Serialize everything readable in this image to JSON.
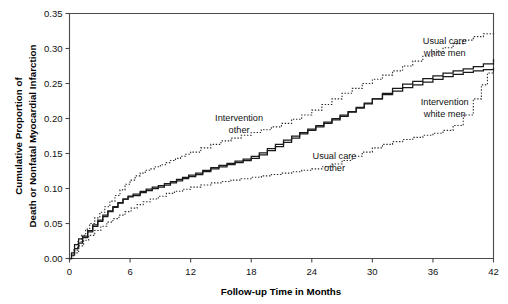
{
  "chart_data": {
    "type": "line",
    "title": "",
    "subtitle": "",
    "xlabel": "Follow-up Time in Months",
    "ylabel": "Cumulative Proportion of Death or Nonfatal Myocardial Infarction",
    "ylabel_line1": "Cumulative Proportion of",
    "ylabel_line2": "Death or Nonfatal Myocardial Infarction",
    "xlim": [
      0,
      42
    ],
    "ylim": [
      0,
      0.35
    ],
    "xticks": [
      0,
      6,
      12,
      18,
      24,
      30,
      36,
      42
    ],
    "xticklabels": [
      "0",
      "6",
      "12",
      "18",
      "24",
      "30",
      "36",
      "42"
    ],
    "yticks": [
      0.0,
      0.05,
      0.1,
      0.15,
      0.2,
      0.25,
      0.3,
      0.35
    ],
    "yticklabels": [
      "0.00",
      "0.05",
      "0.10",
      "0.15",
      "0.20",
      "0.25",
      "0.30",
      "0.35"
    ],
    "grid": false,
    "legend_position": "inline-annotations",
    "step_style": "post",
    "series": [
      {
        "name": "Usual care white men",
        "style": "dotted",
        "color": "#2b2b2b",
        "final_value": 0.325,
        "x": [
          0,
          0.4,
          0.8,
          1.2,
          1.6,
          2.0,
          2.5,
          3.0,
          3.5,
          4.0,
          4.5,
          5.0,
          5.5,
          6.0,
          6.5,
          7.0,
          7.5,
          8.0,
          8.5,
          9.0,
          9.5,
          10.0,
          10.5,
          11.0,
          11.5,
          12.0,
          13.0,
          14.0,
          15.0,
          16.0,
          17.0,
          18.0,
          19.0,
          20.0,
          21.0,
          22.0,
          23.0,
          24.0,
          25.0,
          26.0,
          27.0,
          28.0,
          29.0,
          30.0,
          31.0,
          32.0,
          33.0,
          34.0,
          35.0,
          36.0,
          37.0,
          38.0,
          39.0,
          40.0,
          41.0,
          42.0
        ],
        "y": [
          0.0,
          0.012,
          0.024,
          0.033,
          0.042,
          0.05,
          0.058,
          0.066,
          0.074,
          0.082,
          0.09,
          0.098,
          0.106,
          0.112,
          0.118,
          0.122,
          0.126,
          0.128,
          0.131,
          0.134,
          0.137,
          0.14,
          0.143,
          0.146,
          0.149,
          0.152,
          0.158,
          0.163,
          0.168,
          0.172,
          0.176,
          0.18,
          0.184,
          0.188,
          0.193,
          0.199,
          0.205,
          0.212,
          0.22,
          0.228,
          0.236,
          0.243,
          0.25,
          0.256,
          0.262,
          0.268,
          0.275,
          0.282,
          0.289,
          0.295,
          0.301,
          0.307,
          0.312,
          0.317,
          0.321,
          0.325
        ]
      },
      {
        "name": "Usual care other",
        "style": "solid",
        "color": "#1a1a1a",
        "final_value": 0.285,
        "x": [
          0,
          0.2,
          0.5,
          0.9,
          1.3,
          1.8,
          2.3,
          2.8,
          3.3,
          3.8,
          4.3,
          4.8,
          5.3,
          5.8,
          6.3,
          7.0,
          7.6,
          8.2,
          8.8,
          9.4,
          10.0,
          10.6,
          11.2,
          11.8,
          12.5,
          13.2,
          14.0,
          14.8,
          15.6,
          16.4,
          17.2,
          18.0,
          18.8,
          19.6,
          20.4,
          21.2,
          22.0,
          22.8,
          23.6,
          24.4,
          25.2,
          26.0,
          26.8,
          27.6,
          28.4,
          29.2,
          30.0,
          31.0,
          32.0,
          33.0,
          34.0,
          35.0,
          36.0,
          37.0,
          38.0,
          39.0,
          40.0,
          41.0,
          42.0
        ],
        "y": [
          0.0,
          0.008,
          0.02,
          0.028,
          0.03,
          0.038,
          0.046,
          0.053,
          0.06,
          0.067,
          0.073,
          0.079,
          0.085,
          0.088,
          0.09,
          0.094,
          0.097,
          0.1,
          0.102,
          0.105,
          0.108,
          0.111,
          0.114,
          0.117,
          0.12,
          0.124,
          0.128,
          0.131,
          0.134,
          0.137,
          0.14,
          0.143,
          0.148,
          0.154,
          0.16,
          0.166,
          0.172,
          0.178,
          0.183,
          0.188,
          0.193,
          0.198,
          0.203,
          0.209,
          0.215,
          0.221,
          0.228,
          0.236,
          0.243,
          0.249,
          0.253,
          0.257,
          0.261,
          0.265,
          0.268,
          0.271,
          0.274,
          0.278,
          0.285
        ]
      },
      {
        "name": "Intervention other",
        "style": "solid",
        "color": "#1a1a1a",
        "final_value": 0.272,
        "x": [
          0,
          0.2,
          0.5,
          0.9,
          1.3,
          1.8,
          2.3,
          2.8,
          3.3,
          3.8,
          4.3,
          4.8,
          5.3,
          5.8,
          6.3,
          7.0,
          7.6,
          8.2,
          8.8,
          9.4,
          10.0,
          10.6,
          11.2,
          11.8,
          12.5,
          13.2,
          14.0,
          14.8,
          15.6,
          16.4,
          17.2,
          18.0,
          18.8,
          19.6,
          20.4,
          21.2,
          22.0,
          22.8,
          23.6,
          24.4,
          25.2,
          26.0,
          26.8,
          27.6,
          28.4,
          29.2,
          30.0,
          31.0,
          32.0,
          33.0,
          34.0,
          35.0,
          36.0,
          37.0,
          38.0,
          39.0,
          40.0,
          41.0,
          42.0
        ],
        "y": [
          0.0,
          0.005,
          0.014,
          0.022,
          0.032,
          0.04,
          0.048,
          0.055,
          0.062,
          0.068,
          0.074,
          0.08,
          0.085,
          0.089,
          0.092,
          0.096,
          0.099,
          0.102,
          0.104,
          0.107,
          0.11,
          0.113,
          0.116,
          0.119,
          0.122,
          0.126,
          0.13,
          0.133,
          0.136,
          0.139,
          0.142,
          0.146,
          0.151,
          0.157,
          0.163,
          0.169,
          0.175,
          0.18,
          0.185,
          0.19,
          0.195,
          0.2,
          0.205,
          0.21,
          0.216,
          0.222,
          0.228,
          0.234,
          0.239,
          0.244,
          0.248,
          0.252,
          0.256,
          0.26,
          0.263,
          0.266,
          0.268,
          0.27,
          0.272
        ]
      },
      {
        "name": "Intervention white men",
        "style": "dotted",
        "color": "#2b2b2b",
        "final_value": 0.278,
        "x": [
          0,
          0.4,
          0.9,
          1.4,
          1.9,
          2.5,
          3.1,
          3.7,
          4.3,
          4.9,
          5.5,
          6.1,
          6.7,
          7.3,
          8.0,
          8.8,
          9.6,
          10.4,
          11.2,
          12.0,
          13.0,
          14.0,
          15.0,
          16.0,
          17.0,
          18.0,
          19.0,
          20.0,
          21.0,
          22.0,
          23.0,
          24.0,
          25.0,
          26.0,
          27.0,
          28.0,
          29.0,
          30.0,
          31.0,
          32.0,
          33.0,
          34.0,
          35.0,
          36.0,
          37.0,
          38.0,
          39.0,
          40.0,
          40.8,
          41.4,
          42.0
        ],
        "y": [
          0.0,
          0.008,
          0.018,
          0.026,
          0.033,
          0.04,
          0.046,
          0.052,
          0.057,
          0.062,
          0.067,
          0.072,
          0.077,
          0.081,
          0.085,
          0.089,
          0.093,
          0.096,
          0.099,
          0.102,
          0.105,
          0.108,
          0.11,
          0.112,
          0.114,
          0.116,
          0.118,
          0.12,
          0.122,
          0.124,
          0.126,
          0.128,
          0.131,
          0.135,
          0.14,
          0.146,
          0.152,
          0.158,
          0.163,
          0.167,
          0.17,
          0.173,
          0.176,
          0.179,
          0.183,
          0.19,
          0.205,
          0.228,
          0.248,
          0.265,
          0.278
        ]
      }
    ],
    "annotations": [
      {
        "text_line1": "Intervention",
        "text_line2": "other",
        "x": 0.4,
        "y": 0.56
      },
      {
        "text_line1": "Usual care",
        "text_line2": "other",
        "x": 0.625,
        "y": 0.405
      },
      {
        "text_line1": "Usual care",
        "text_line2": "white men",
        "x": 0.885,
        "y": 0.875
      },
      {
        "text_line1": "Intervention",
        "text_line2": "white men",
        "x": 0.885,
        "y": 0.625
      }
    ]
  },
  "colors": {
    "axis": "#4a4a4a",
    "solid_curve": "#1a1a1a",
    "dotted_curve": "#2b2b2b",
    "background": "#ffffff",
    "text": "#111111"
  }
}
